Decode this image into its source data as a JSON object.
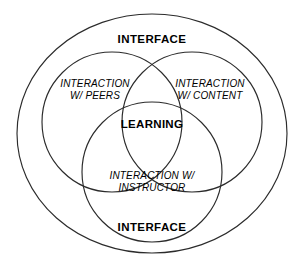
{
  "diagram": {
    "title_top": "INTERFACE",
    "title_bottom": "INTERFACE",
    "center_label": "LEARNING",
    "circles": [
      {
        "id": "peers",
        "label": "INTERACTION\nW/ PEERS"
      },
      {
        "id": "content",
        "label": "INTERACTION\nW/ CONTENT"
      },
      {
        "id": "instructor",
        "label": "INTERACTION W/\nINSTRUCTOR"
      }
    ],
    "colors": {
      "stroke": "#2b2b2b",
      "background": "#ffffff",
      "text": "#000000"
    }
  }
}
